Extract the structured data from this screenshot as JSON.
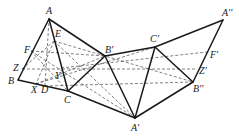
{
  "diagram": {
    "points": {
      "A": {
        "label": "A",
        "x": 49,
        "y": 19,
        "lx": 46,
        "ly": 14
      },
      "B": {
        "label": "B",
        "x": 18,
        "y": 80,
        "lx": 8,
        "ly": 84
      },
      "C": {
        "label": "C",
        "x": 68,
        "y": 91,
        "lx": 64,
        "ly": 103
      },
      "E": {
        "label": "E",
        "x": 54,
        "y": 41,
        "lx": 55,
        "ly": 37
      },
      "F": {
        "label": "F",
        "x": 31,
        "y": 51,
        "lx": 24,
        "ly": 53
      },
      "Z": {
        "label": "Z",
        "x": 22,
        "y": 69,
        "lx": 13,
        "ly": 71
      },
      "X": {
        "label": "X",
        "x": 36,
        "y": 84,
        "lx": 31,
        "ly": 93
      },
      "D": {
        "label": "D",
        "x": 45,
        "y": 86,
        "lx": 41,
        "ly": 93
      },
      "Y": {
        "label": "Y",
        "x": 61,
        "y": 68,
        "lx": 55,
        "ly": 79
      },
      "B1": {
        "label": "B'",
        "x": 105,
        "y": 56,
        "lx": 105,
        "ly": 53
      },
      "A1": {
        "label": "A'",
        "x": 135,
        "y": 118,
        "lx": 131,
        "ly": 131
      },
      "C1": {
        "label": "C'",
        "x": 155,
        "y": 47,
        "lx": 150,
        "ly": 42
      },
      "B2": {
        "label": "B''",
        "x": 193,
        "y": 82,
        "lx": 193,
        "ly": 92
      },
      "A2": {
        "label": "A''",
        "x": 223,
        "y": 20,
        "lx": 222,
        "ly": 16
      },
      "F1": {
        "label": "F'",
        "x": 207,
        "y": 52,
        "lx": 210,
        "ly": 58
      },
      "Z1": {
        "label": "Z'",
        "x": 197,
        "y": 69,
        "lx": 199,
        "ly": 74
      }
    },
    "solid_segments": [
      [
        "A",
        "B"
      ],
      [
        "B",
        "C"
      ],
      [
        "A",
        "C"
      ],
      [
        "A",
        "B1"
      ],
      [
        "C",
        "B1"
      ],
      [
        "C",
        "A1"
      ],
      [
        "B1",
        "A1"
      ],
      [
        "B1",
        "C1"
      ],
      [
        "A1",
        "C1"
      ],
      [
        "C1",
        "B2"
      ],
      [
        "A1",
        "B2"
      ],
      [
        "C1",
        "A2"
      ],
      [
        "A2",
        "B2"
      ]
    ],
    "dashed_segments": [
      [
        "Z",
        "Z1"
      ],
      [
        "F",
        "B1"
      ],
      [
        "E",
        "A1"
      ],
      [
        "X",
        "C1"
      ],
      [
        "D",
        "B2"
      ],
      [
        "F",
        "C"
      ],
      [
        "E",
        "X"
      ],
      [
        "D",
        "A"
      ],
      [
        "Y",
        "F1"
      ],
      [
        "Z",
        "E"
      ],
      [
        "X",
        "B1"
      ],
      [
        "E",
        "B2"
      ],
      [
        "F",
        "A1"
      ]
    ]
  }
}
